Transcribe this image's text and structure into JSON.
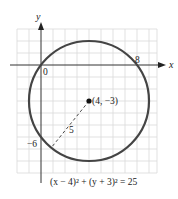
{
  "figure": {
    "axis_labels": {
      "x": "x",
      "y": "y"
    },
    "tick_labels": {
      "origin": "0",
      "x_intercept": "8",
      "y_intercept": "−6"
    },
    "center_label": "(4, −3)",
    "radius_label": "5",
    "equation": "(x − 4)² + (y + 3)² = 25",
    "center": {
      "x": 4,
      "y": -3
    },
    "radius": 5,
    "colors": {
      "circle": "#444444",
      "grid": "#d9d9d9",
      "axis": "#333333",
      "point": "#111111"
    }
  }
}
